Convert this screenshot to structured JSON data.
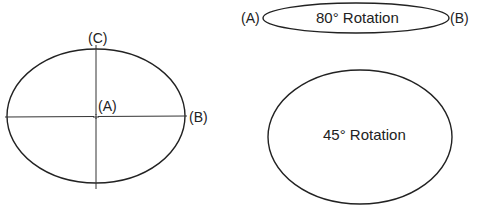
{
  "diagram": {
    "type": "ellipse-rotation-illustration",
    "colors": {
      "stroke": "#222222",
      "background": "#ffffff",
      "axis": "#333333"
    },
    "reference_ellipse": {
      "labels": {
        "center": "(A)",
        "major_axis_end": "(B)",
        "minor_axis_end": "(C)"
      }
    },
    "rotation_80": {
      "caption": "80° Rotation",
      "labels": {
        "left": "(A)",
        "right": "(B)"
      }
    },
    "rotation_45": {
      "caption": "45° Rotation"
    }
  }
}
